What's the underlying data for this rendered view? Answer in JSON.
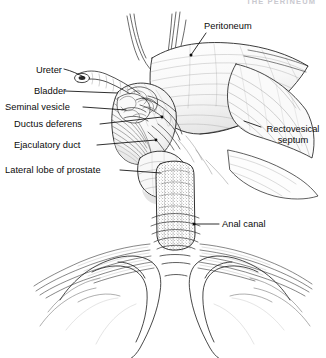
{
  "running_head": "THE PERINEUM",
  "figure": {
    "name": "male-pelvis-coronal-dissection",
    "background_color": "#ffffff",
    "ink_color": "#1a1a1a",
    "label_color": "#0b0b0b"
  },
  "labels": [
    {
      "id": "ureter",
      "text": "Ureter",
      "side": "left",
      "x": 36,
      "y": 65,
      "anchor_x": 95,
      "anchor_y": 76
    },
    {
      "id": "bladder",
      "text": "Bladder",
      "side": "left",
      "x": 34,
      "y": 87,
      "anchor_x": 118,
      "anchor_y": 94
    },
    {
      "id": "seminal-vesicle",
      "text": "Seminal vesicle",
      "side": "left",
      "x": 6,
      "y": 103,
      "anchor_x": 124,
      "anchor_y": 109
    },
    {
      "id": "ductus-deferens",
      "text": "Ductus deferens",
      "side": "left",
      "x": 14,
      "y": 120,
      "anchor_x": 160,
      "anchor_y": 116
    },
    {
      "id": "ejaculatory-duct",
      "text": "Ejaculatory duct",
      "side": "left",
      "x": 14,
      "y": 141,
      "anchor_x": 155,
      "anchor_y": 139
    },
    {
      "id": "lateral-lobe",
      "text": "Lateral lobe of prostate",
      "side": "left",
      "x": 6,
      "y": 166,
      "anchor_x": 160,
      "anchor_y": 172
    },
    {
      "id": "peritoneum",
      "text": "Peritoneum",
      "side": "right",
      "x": 203,
      "y": 22,
      "anchor_x": 197,
      "anchor_y": 52
    },
    {
      "id": "rectovesical",
      "text": "Rectovesical septum",
      "side": "right",
      "x": 263,
      "y": 124,
      "anchor_x": 247,
      "anchor_y": 122
    },
    {
      "id": "anal-canal",
      "text": "Anal canal",
      "side": "right",
      "x": 221,
      "y": 220,
      "anchor_x": 196,
      "anchor_y": 224
    }
  ],
  "structures": [
    "peritoneum",
    "bladder",
    "ureter",
    "seminal vesicle",
    "ductus deferens",
    "ejaculatory duct",
    "lateral lobe of prostate",
    "rectovesical septum",
    "anal canal",
    "levator ani"
  ]
}
